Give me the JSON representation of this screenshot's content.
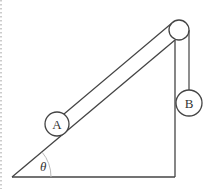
{
  "diagram": {
    "labels": {
      "block_a": "A",
      "block_b": "B",
      "angle": "θ"
    },
    "colors": {
      "stroke": "#444444",
      "background": "#ffffff",
      "arc": "#bbbbbb",
      "dotted_border": "#999999"
    }
  }
}
